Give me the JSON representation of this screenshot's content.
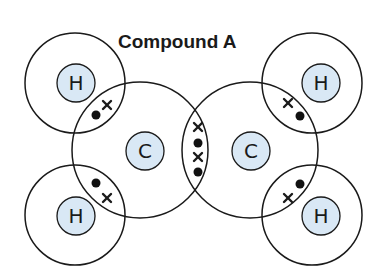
{
  "title": "Compound A",
  "atoms": {
    "h_top_left": "H",
    "h_bottom_left": "H",
    "h_top_right": "H",
    "h_bottom_right": "H",
    "c_left": "C",
    "c_right": "C"
  },
  "colors": {
    "nucleus_fill": "#d9e8f5",
    "stroke": "#1a1a1a"
  },
  "bonds": {
    "c_h_single": "one dot and one cross shared",
    "c_c_double": "two dots and two crosses shared"
  }
}
